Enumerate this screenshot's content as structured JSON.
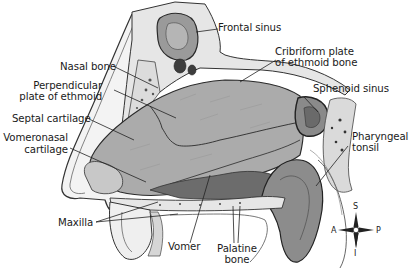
{
  "diagram": {
    "labels": {
      "frontal_sinus": "Frontal sinus",
      "nasal_bone": "Nasal bone",
      "cribriform_plate_l1": "Cribriform plate",
      "cribriform_plate_l2": "of ethmoid bone",
      "perpendicular_plate_l1": "Perpendicular",
      "perpendicular_plate_l2": "plate of ethmoid",
      "sphenoid_sinus": "Sphenoid sinus",
      "septal_cartilage": "Septal cartilage",
      "pharyngeal_tonsil_l1": "Pharyngeal",
      "pharyngeal_tonsil_l2": "tonsil",
      "vomeronasal_cartilage_l1": "Vomeronasal",
      "vomeronasal_cartilage_l2": "cartilage",
      "maxilla": "Maxilla",
      "vomer": "Vomer",
      "palatine_bone_l1": "Palatine",
      "palatine_bone_l2": "bone"
    },
    "compass": {
      "superior": "S",
      "inferior": "I",
      "anterior": "A",
      "posterior": "P"
    },
    "colors": {
      "background": "#ffffff",
      "septum": "#a9a9a9",
      "bone": "#e4e4e4",
      "dark_tissue": "#6a6a6a",
      "outline": "#2a2a2a",
      "text": "#1a1a1a"
    }
  }
}
